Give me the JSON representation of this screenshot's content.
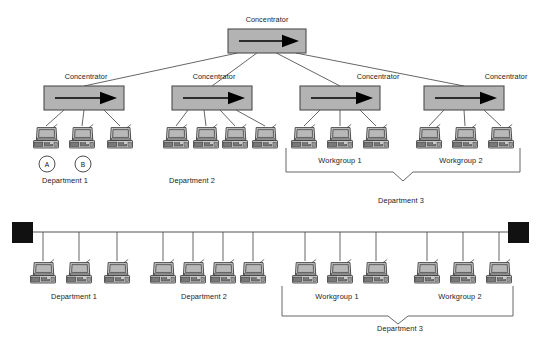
{
  "diagram": {
    "title_text": "",
    "labels": {
      "concentrator": "Concentrator",
      "department_1": "Department 1",
      "department_2": "Department 2",
      "department_3": "Department 3",
      "workgroup_1": "Workgroup 1",
      "workgroup_2": "Workgroup 2",
      "node_a": "A",
      "node_b": "B"
    },
    "colors": {
      "concentrator_fill": "#b3b3b3",
      "concentrator_stroke": "#4d4d4d",
      "arrow": "#000000",
      "line": "#555555",
      "terminator": "#111111",
      "monitor_screen": "#a6a6a6",
      "computer_body": "#d4d4d4",
      "computer_outline": "#3a3a3a",
      "text": "#1a1a1a"
    },
    "top_section": {
      "root_concentrator": {
        "label": "Concentrator",
        "x": 228,
        "y": 29,
        "w": 78,
        "h": 24,
        "label_x": 267,
        "label_y": 15
      },
      "concentrators": [
        {
          "label": "Concentrator",
          "x": 44,
          "y": 86,
          "w": 80,
          "h": 24,
          "label_x": 58,
          "label_y": 72
        },
        {
          "label": "Concentrator",
          "x": 172,
          "y": 86,
          "w": 80,
          "h": 24,
          "label_x": 186,
          "label_y": 72
        },
        {
          "label": "Concentrator",
          "x": 300,
          "y": 86,
          "w": 80,
          "h": 24,
          "label_x": 350,
          "label_y": 72
        },
        {
          "label": "Concentrator",
          "x": 424,
          "y": 86,
          "w": 80,
          "h": 24,
          "label_x": 478,
          "label_y": 72
        }
      ],
      "computers": [
        {
          "x": 33,
          "y": 126,
          "group": "Department 1"
        },
        {
          "x": 69,
          "y": 126,
          "group": "Department 1"
        },
        {
          "x": 107,
          "y": 126,
          "group": "Department 1"
        },
        {
          "x": 163,
          "y": 126,
          "group": "Department 2"
        },
        {
          "x": 193,
          "y": 126,
          "group": "Department 2"
        },
        {
          "x": 222,
          "y": 126,
          "group": "Department 2"
        },
        {
          "x": 252,
          "y": 126,
          "group": "Department 2"
        },
        {
          "x": 291,
          "y": 126,
          "group": "Workgroup 1"
        },
        {
          "x": 327,
          "y": 126,
          "group": "Workgroup 1"
        },
        {
          "x": 363,
          "y": 126,
          "group": "Workgroup 1"
        },
        {
          "x": 416,
          "y": 126,
          "group": "Workgroup 2"
        },
        {
          "x": 452,
          "y": 126,
          "group": "Workgroup 2"
        },
        {
          "x": 488,
          "y": 126,
          "group": "Workgroup 2"
        }
      ],
      "circles": [
        {
          "letter": "A",
          "cx": 47,
          "cy": 164,
          "r": 8
        },
        {
          "letter": "B",
          "cx": 83,
          "cy": 164,
          "r": 8
        }
      ],
      "group_labels": [
        {
          "text": "Department 1",
          "x": 65,
          "y": 176
        },
        {
          "text": "Department 2",
          "x": 192,
          "y": 176
        },
        {
          "text": "Workgroup 1",
          "x": 340,
          "y": 156
        },
        {
          "text": "Workgroup 2",
          "x": 461,
          "y": 156
        },
        {
          "text": "Department 3",
          "x": 401,
          "y": 196
        }
      ],
      "bracket": {
        "left": 286,
        "right": 520,
        "top": 148,
        "bottom": 172,
        "notch_center": 403,
        "notch_depth": 9
      }
    },
    "bottom_section": {
      "bus_y": 232,
      "bus_left": 22,
      "bus_right": 519,
      "terminators": [
        {
          "x": 12,
          "y": 222,
          "w": 21,
          "h": 21
        },
        {
          "x": 508,
          "y": 222,
          "w": 21,
          "h": 21
        }
      ],
      "computers": [
        {
          "x": 30,
          "y": 261,
          "group": "Department 1"
        },
        {
          "x": 66,
          "y": 261,
          "group": "Department 1"
        },
        {
          "x": 104,
          "y": 261,
          "group": "Department 1"
        },
        {
          "x": 150,
          "y": 261,
          "group": "Department 2"
        },
        {
          "x": 180,
          "y": 261,
          "group": "Department 2"
        },
        {
          "x": 210,
          "y": 261,
          "group": "Department 2"
        },
        {
          "x": 240,
          "y": 261,
          "group": "Department 2"
        },
        {
          "x": 292,
          "y": 261,
          "group": "Workgroup 1"
        },
        {
          "x": 327,
          "y": 261,
          "group": "Workgroup 1"
        },
        {
          "x": 363,
          "y": 261,
          "group": "Workgroup 1"
        },
        {
          "x": 414,
          "y": 261,
          "group": "Workgroup 2"
        },
        {
          "x": 450,
          "y": 261,
          "group": "Workgroup 2"
        },
        {
          "x": 486,
          "y": 261,
          "group": "Workgroup 2"
        }
      ],
      "group_labels": [
        {
          "text": "Department 1",
          "x": 74,
          "y": 292
        },
        {
          "text": "Department 2",
          "x": 204,
          "y": 292
        },
        {
          "text": "Workgroup 1",
          "x": 337,
          "y": 292
        },
        {
          "text": "Workgroup 2",
          "x": 460,
          "y": 292
        },
        {
          "text": "Department 3",
          "x": 400,
          "y": 324
        }
      ],
      "bracket": {
        "left": 282,
        "right": 513,
        "top": 296,
        "bottom": 316,
        "notch_center": 398,
        "notch_depth": 8
      }
    }
  }
}
